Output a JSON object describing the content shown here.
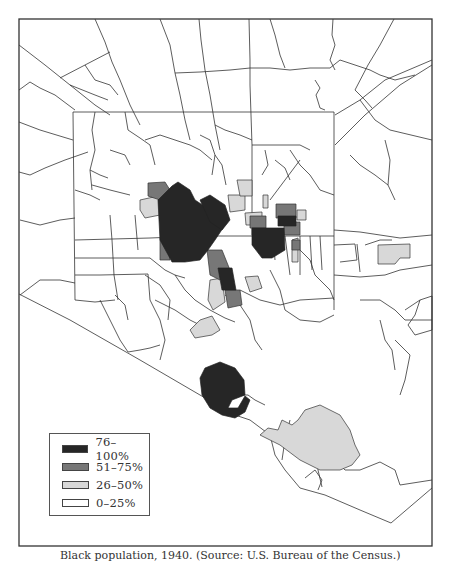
{
  "map": {
    "title": "Black population by census tract",
    "fill_colors": {
      "76-100": "#262626",
      "51-75": "#777777",
      "26-50": "#d8d8d8",
      "0-25": "#ffffff"
    },
    "line_color": "#333333"
  },
  "legend": {
    "items": [
      {
        "label": "76–100%",
        "color": "#262626"
      },
      {
        "label": "51–75%",
        "color": "#777777"
      },
      {
        "label": "26–50%",
        "color": "#d8d8d8"
      },
      {
        "label": "0–25%",
        "color": "#ffffff"
      }
    ]
  },
  "caption": "Black population, 1940. (Source: U.S. Bureau of the Census.)"
}
